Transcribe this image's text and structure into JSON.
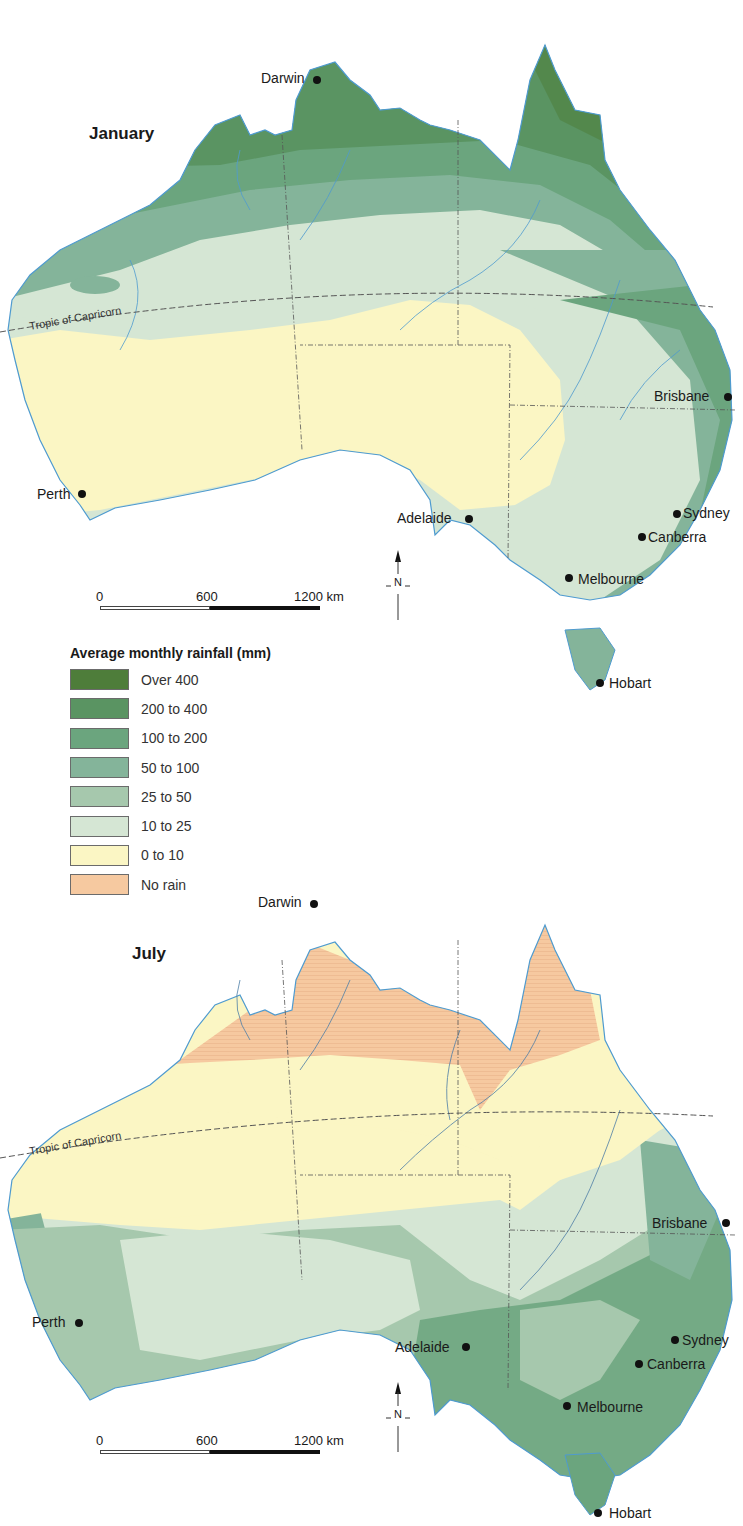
{
  "legend": {
    "title": "Average monthly rainfall (mm)",
    "items": [
      {
        "label": "Over 400",
        "color": "#4e7d3a"
      },
      {
        "label": "200 to 400",
        "color": "#5a9462"
      },
      {
        "label": "100 to 200",
        "color": "#6ba57e"
      },
      {
        "label": "50 to 100",
        "color": "#84b49a"
      },
      {
        "label": "25 to 50",
        "color": "#a6c8ad"
      },
      {
        "label": "10 to 25",
        "color": "#d5e6d4"
      },
      {
        "label": "0 to 10",
        "color": "#fbf6c4"
      },
      {
        "label": "No rain",
        "color": "#f6c9a0"
      }
    ]
  },
  "maps": [
    {
      "title": "January",
      "tropic_label": "Tropic of Capricorn",
      "scale": {
        "start": "0",
        "mid": "600",
        "end": "1200 km"
      },
      "north_label": "N",
      "cities": {
        "darwin": "Darwin",
        "brisbane": "Brisbane",
        "perth": "Perth",
        "adelaide": "Adelaide",
        "sydney": "Sydney",
        "canberra": "Canberra",
        "melbourne": "Melbourne",
        "hobart": "Hobart"
      }
    },
    {
      "title": "July",
      "tropic_label": "Tropic of Capricorn",
      "scale": {
        "start": "0",
        "mid": "600",
        "end": "1200 km"
      },
      "north_label": "N",
      "cities": {
        "darwin": "Darwin",
        "brisbane": "Brisbane",
        "perth": "Perth",
        "adelaide": "Adelaide",
        "sydney": "Sydney",
        "canberra": "Canberra",
        "melbourne": "Melbourne",
        "hobart": "Hobart"
      }
    }
  ],
  "colors": {
    "river": "#4f9bd0",
    "border": "#555555",
    "background": "#ffffff"
  }
}
